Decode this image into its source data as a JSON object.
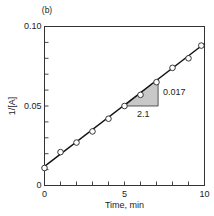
{
  "panel_label": "(b)",
  "chart_data": {
    "type": "scatter",
    "title": "",
    "xlabel": "Time, min",
    "ylabel": "1/[A]",
    "xlim": [
      0,
      10
    ],
    "ylim": [
      0,
      0.1
    ],
    "x_tick_labels": [
      "0",
      "5",
      "10"
    ],
    "y_tick_labels": [
      "0",
      "0.05",
      "0.10"
    ],
    "x_minor_ticks": [
      1,
      2,
      3,
      4,
      5,
      6,
      7,
      8,
      9
    ],
    "y_minor_ticks": [
      0.01,
      0.02,
      0.03,
      0.04,
      0.05,
      0.06,
      0.07,
      0.08,
      0.09
    ],
    "grid": false,
    "legend": null,
    "series": [
      {
        "name": "data",
        "marker": "open-circle",
        "x": [
          0,
          1,
          2,
          3,
          4,
          5,
          6,
          7,
          8,
          9,
          9.8
        ],
        "y": [
          0.011,
          0.021,
          0.027,
          0.034,
          0.042,
          0.05,
          0.057,
          0.065,
          0.074,
          0.08,
          0.088
        ]
      },
      {
        "name": "linear fit",
        "style": "line",
        "x": [
          0,
          10
        ],
        "y": [
          0.012,
          0.0893
        ]
      }
    ],
    "annotations": {
      "slope_triangle": {
        "x0": 5,
        "y0": 0.05,
        "x1": 7.1,
        "y1": 0.067,
        "run_label": "2.1",
        "rise_label": "0.017",
        "fill": "#c8c8c8"
      }
    }
  }
}
